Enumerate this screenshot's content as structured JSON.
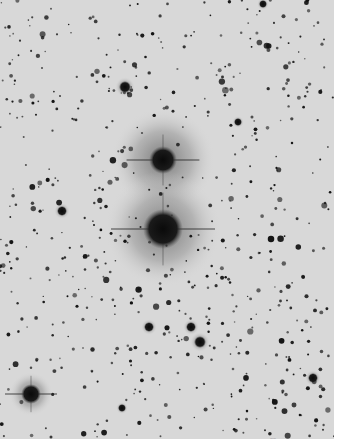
{
  "image": {
    "description": "Inverted (negative) astronomical plate of a dense star field with two bright halo stars",
    "background_color": "#d8d8d8",
    "star_color": "#111111",
    "halo_color": "#9a9a9a",
    "width": 334,
    "height": 439
  },
  "scale_label": "——",
  "bright_stars": [
    {
      "x": 163,
      "y": 160,
      "r": 14,
      "halo": 52,
      "spikes": true
    },
    {
      "x": 163,
      "y": 229,
      "r": 20,
      "halo": 58,
      "spikes": true
    },
    {
      "x": 31,
      "y": 394,
      "r": 10,
      "halo": 22,
      "spikes": true
    },
    {
      "x": 125,
      "y": 87,
      "r": 6,
      "halo": 10,
      "spikes": false
    },
    {
      "x": 200,
      "y": 342,
      "r": 6,
      "halo": 10,
      "spikes": false
    },
    {
      "x": 149,
      "y": 327,
      "r": 5,
      "halo": 8,
      "spikes": false
    },
    {
      "x": 191,
      "y": 327,
      "r": 5,
      "halo": 8,
      "spikes": false
    },
    {
      "x": 62,
      "y": 211,
      "r": 5,
      "halo": 8,
      "spikes": false
    },
    {
      "x": 313,
      "y": 378,
      "r": 5,
      "halo": 8,
      "spikes": false
    },
    {
      "x": 238,
      "y": 122,
      "r": 4,
      "halo": 6,
      "spikes": false
    },
    {
      "x": 122,
      "y": 408,
      "r": 4,
      "halo": 6,
      "spikes": false
    },
    {
      "x": 263,
      "y": 4,
      "r": 4,
      "halo": 6,
      "spikes": false
    }
  ],
  "star_field_seed": 7,
  "star_field_count": 620
}
